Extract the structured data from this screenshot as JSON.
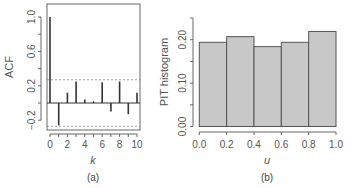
{
  "chart_data": [
    {
      "type": "bar",
      "panel_label": "(a)",
      "title": "",
      "xlabel": "k",
      "ylabel": "ACF",
      "x": [
        0,
        1,
        2,
        3,
        4,
        5,
        6,
        7,
        8,
        9,
        10
      ],
      "values": [
        1.0,
        -0.26,
        0.12,
        0.25,
        0.04,
        0.02,
        0.24,
        -0.1,
        0.25,
        -0.13,
        0.12
      ],
      "confidence_bounds": [
        0.27,
        -0.27
      ],
      "xticks": [
        "0",
        "2",
        "4",
        "6",
        "8",
        "10"
      ],
      "yticks": [
        "-0.2",
        "0.2",
        "0.6",
        "1.0"
      ],
      "ylim": [
        -0.3,
        1.05
      ],
      "xlim": [
        -0.4,
        10.4
      ],
      "grid": false,
      "style": "lollipop spikes with dashed confidence lines"
    },
    {
      "type": "bar",
      "panel_label": "(b)",
      "title": "",
      "xlabel": "u",
      "ylabel": "PIT histogram",
      "categories": [
        "0.0-0.2",
        "0.2-0.4",
        "0.4-0.6",
        "0.6-0.8",
        "0.8-1.0"
      ],
      "bin_edges": [
        0.0,
        0.2,
        0.4,
        0.6,
        0.8,
        1.0
      ],
      "values": [
        0.194,
        0.207,
        0.184,
        0.194,
        0.219
      ],
      "xticks": [
        "0.0",
        "0.2",
        "0.4",
        "0.6",
        "0.8",
        "1.0"
      ],
      "yticks": [
        "0.00",
        "0.10",
        "0.20"
      ],
      "ylim": [
        0,
        0.25
      ],
      "xlim": [
        0,
        1
      ],
      "grid": false
    }
  ],
  "colors": {
    "bar_fill": "#c8c8c8",
    "bar_edge": "#555555",
    "spike": "#333333",
    "axis": "#666666",
    "dashed": "#888888"
  }
}
